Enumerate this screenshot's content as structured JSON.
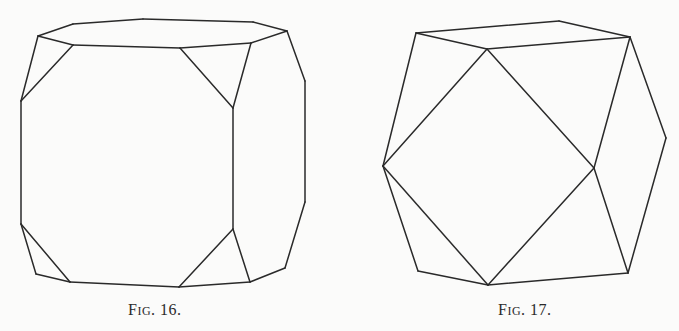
{
  "figures": [
    {
      "id": "fig16",
      "caption": {
        "prefix_cap": "F",
        "prefix_small": "IG",
        "number": ". 16."
      },
      "description": "Cube with truncated corners (cube modified by octahedron faces)",
      "stroke_color": "#2a2a2a",
      "edges": [
        [
          [
            38,
            36
          ],
          [
            73,
            24
          ]
        ],
        [
          [
            73,
            24
          ],
          [
            143,
            19
          ]
        ],
        [
          [
            143,
            19
          ],
          [
            253,
            22
          ]
        ],
        [
          [
            253,
            22
          ],
          [
            287,
            31
          ]
        ],
        [
          [
            38,
            36
          ],
          [
            73,
            45
          ]
        ],
        [
          [
            73,
            45
          ],
          [
            180,
            48
          ]
        ],
        [
          [
            180,
            48
          ],
          [
            251,
            43
          ]
        ],
        [
          [
            251,
            43
          ],
          [
            287,
            31
          ]
        ],
        [
          [
            38,
            36
          ],
          [
            21,
            101
          ]
        ],
        [
          [
            73,
            45
          ],
          [
            21,
            101
          ]
        ],
        [
          [
            180,
            48
          ],
          [
            233,
            108
          ]
        ],
        [
          [
            251,
            43
          ],
          [
            233,
            108
          ]
        ],
        [
          [
            287,
            31
          ],
          [
            305,
            81
          ]
        ],
        [
          [
            305,
            81
          ],
          [
            305,
            202
          ]
        ],
        [
          [
            305,
            202
          ],
          [
            285,
            268
          ]
        ],
        [
          [
            21,
            101
          ],
          [
            21,
            224
          ]
        ],
        [
          [
            233,
            108
          ],
          [
            233,
            229
          ]
        ],
        [
          [
            21,
            224
          ],
          [
            36,
            274
          ]
        ],
        [
          [
            36,
            274
          ],
          [
            70,
            282
          ]
        ],
        [
          [
            21,
            224
          ],
          [
            70,
            282
          ]
        ],
        [
          [
            233,
            229
          ],
          [
            179,
            287
          ]
        ],
        [
          [
            233,
            229
          ],
          [
            250,
            282
          ]
        ],
        [
          [
            70,
            282
          ],
          [
            179,
            287
          ]
        ],
        [
          [
            179,
            287
          ],
          [
            250,
            282
          ]
        ],
        [
          [
            250,
            282
          ],
          [
            285,
            268
          ]
        ]
      ]
    },
    {
      "id": "fig17",
      "caption": {
        "prefix_cap": "F",
        "prefix_small": "IG",
        "number": ". 17."
      },
      "description": "Cuboctahedron",
      "stroke_color": "#2a2a2a",
      "edges": [
        [
          [
            416,
            33
          ],
          [
            559,
            21
          ]
        ],
        [
          [
            559,
            21
          ],
          [
            630,
            37
          ]
        ],
        [
          [
            630,
            37
          ],
          [
            487,
            49
          ]
        ],
        [
          [
            487,
            49
          ],
          [
            416,
            33
          ]
        ],
        [
          [
            416,
            33
          ],
          [
            383,
            166
          ]
        ],
        [
          [
            487,
            49
          ],
          [
            383,
            166
          ]
        ],
        [
          [
            487,
            49
          ],
          [
            594,
            168
          ]
        ],
        [
          [
            630,
            37
          ],
          [
            594,
            168
          ]
        ],
        [
          [
            630,
            37
          ],
          [
            666,
            138
          ]
        ],
        [
          [
            666,
            138
          ],
          [
            628,
            273
          ]
        ],
        [
          [
            383,
            166
          ],
          [
            418,
            271
          ]
        ],
        [
          [
            418,
            271
          ],
          [
            488,
            285
          ]
        ],
        [
          [
            383,
            166
          ],
          [
            488,
            285
          ]
        ],
        [
          [
            594,
            168
          ],
          [
            488,
            285
          ]
        ],
        [
          [
            594,
            168
          ],
          [
            628,
            273
          ]
        ],
        [
          [
            488,
            285
          ],
          [
            628,
            273
          ]
        ]
      ]
    }
  ]
}
